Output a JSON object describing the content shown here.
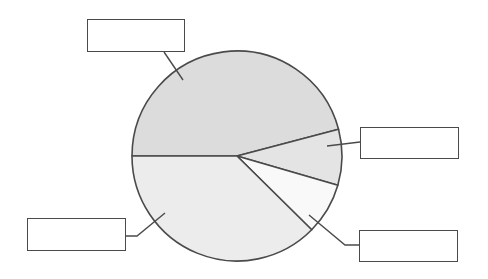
{
  "chart_data": {
    "type": "pie",
    "title": "",
    "center": [
      237,
      156
    ],
    "radius": 105,
    "start_angle_deg": 180,
    "slices": [
      {
        "label": "",
        "value": 45.9,
        "color": "#dcdcdc"
      },
      {
        "label": "",
        "value": 8.6,
        "color": "#e4e4e4"
      },
      {
        "label": "",
        "value": 7.9,
        "color": "#f9f9f9"
      },
      {
        "label": "",
        "value": 37.6,
        "color": "#ececec"
      }
    ],
    "legend": "none",
    "annotations": "four blank label callout boxes connected to slices by leader lines"
  },
  "colors": {
    "stroke": "#4a4a4a",
    "background": "#ffffff"
  },
  "callouts": [
    {
      "name": "callout-top-slice",
      "text": "",
      "box": [
        87,
        19,
        98,
        33
      ],
      "leader": [
        [
          164,
          52
        ],
        [
          183,
          80
        ]
      ]
    },
    {
      "name": "callout-right-slice",
      "text": "",
      "box": [
        360,
        127,
        99,
        32
      ],
      "leader": [
        [
          360,
          142
        ],
        [
          327,
          146
        ]
      ]
    },
    {
      "name": "callout-white-slice",
      "text": "",
      "box": [
        359,
        230,
        99,
        32
      ],
      "leader": [
        [
          359,
          245
        ],
        [
          345,
          245
        ],
        [
          309,
          215
        ]
      ]
    },
    {
      "name": "callout-bottom-slice",
      "text": "",
      "box": [
        27,
        218,
        99,
        33
      ],
      "leader": [
        [
          126,
          236
        ],
        [
          137,
          236
        ],
        [
          165,
          213
        ]
      ]
    }
  ]
}
